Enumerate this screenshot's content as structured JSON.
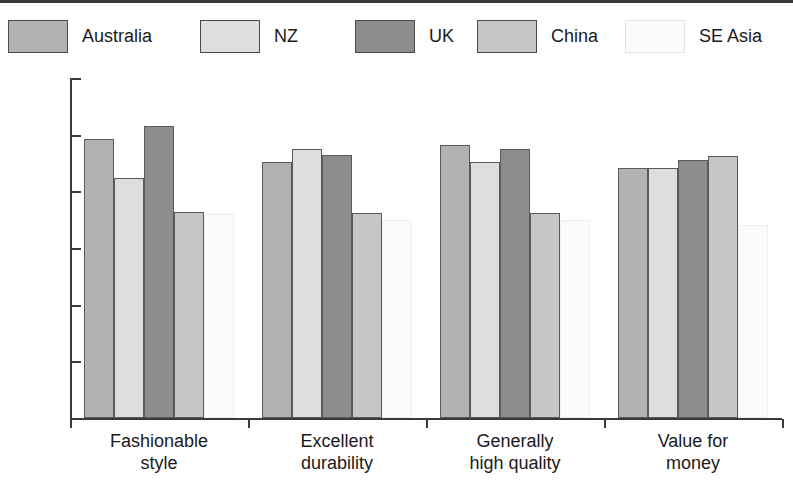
{
  "chart_data": {
    "type": "bar",
    "title": "",
    "subtitle": "",
    "xlabel": "",
    "ylabel": "",
    "ylim": [
      0,
      6
    ],
    "yticks": [
      "0",
      "1",
      "2",
      "3",
      "4",
      "5",
      "6"
    ],
    "grid": false,
    "legend_position": "top",
    "categories": [
      "Fashionable style",
      "Excellent durability",
      "Generally high quality",
      "Value for money"
    ],
    "category_lines": [
      [
        "Fashionable",
        "style"
      ],
      [
        "Excellent",
        "durability"
      ],
      [
        "Generally",
        "high quality"
      ],
      [
        "Value for",
        "money"
      ]
    ],
    "series": [
      {
        "name": "Australia",
        "color": "#b2b2b2",
        "values": [
          4.93,
          4.52,
          4.82,
          4.42
        ]
      },
      {
        "name": "NZ",
        "color": "#dedede",
        "values": [
          4.23,
          4.74,
          4.52,
          4.42
        ]
      },
      {
        "name": "UK",
        "color": "#8d8d8d",
        "values": [
          5.15,
          4.65,
          4.75,
          4.55
        ]
      },
      {
        "name": "China",
        "color": "#c6c6c6",
        "values": [
          3.63,
          3.62,
          3.61,
          4.62
        ]
      },
      {
        "name": "SE Asia",
        "color": "#fbfbfb",
        "values": [
          3.6,
          3.5,
          3.5,
          3.4
        ]
      }
    ]
  },
  "legend": {
    "items": [
      {
        "label": "Australia",
        "color": "#b2b2b2",
        "x": 8,
        "faint": false
      },
      {
        "label": "NZ",
        "color": "#dedede",
        "x": 200,
        "faint": false
      },
      {
        "label": "UK",
        "color": "#8d8d8d",
        "x": 355,
        "faint": false
      },
      {
        "label": "China",
        "color": "#c6c6c6",
        "x": 477,
        "faint": false
      },
      {
        "label": "SE Asia",
        "color": "#fbfbfb",
        "x": 625,
        "faint": true
      }
    ]
  }
}
